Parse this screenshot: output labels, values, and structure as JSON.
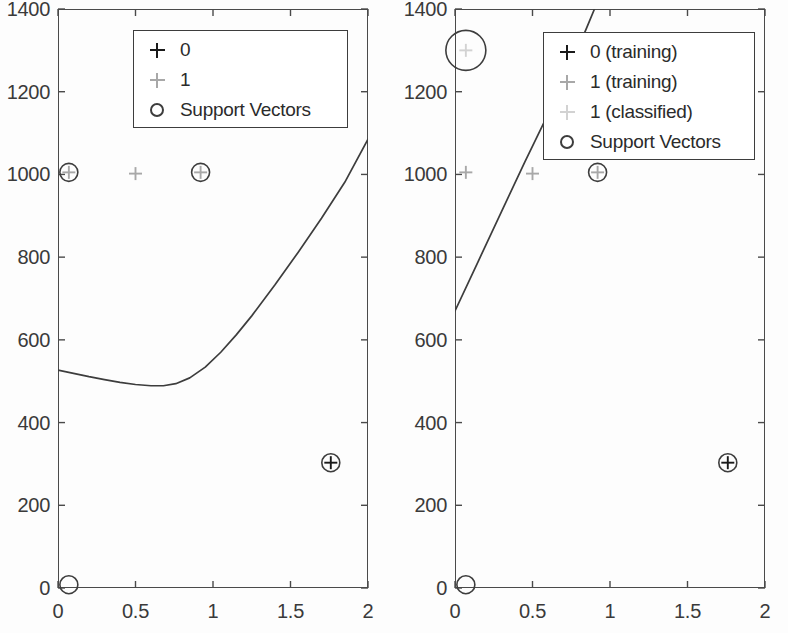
{
  "figure": {
    "background": "#fdfdfd",
    "axis_color": "#4a4a4a",
    "text_color": "#3a3a3a"
  },
  "colors": {
    "class0": "#1a1a1a",
    "class1_training": "#a8a8a8",
    "class1_classified": "#d2d2d2",
    "support_vector": "#3d3d3d",
    "boundary": "#3d3d3d"
  },
  "chart_data": [
    {
      "panel": "left",
      "type": "scatter",
      "title": "",
      "xlabel": "",
      "ylabel": "",
      "xlim": [
        0,
        2
      ],
      "ylim": [
        0,
        1400
      ],
      "xticks": [
        0,
        0.5,
        1,
        1.5,
        2
      ],
      "xtick_labels": [
        "0",
        "0.5",
        "1",
        "1.5",
        "2"
      ],
      "yticks": [
        0,
        200,
        400,
        600,
        800,
        1000,
        1200,
        1400
      ],
      "ytick_labels": [
        "0",
        "200",
        "400",
        "600",
        "800",
        "1000",
        "1200",
        "1400"
      ],
      "grid": false,
      "legend_position": "top-center",
      "legend": [
        {
          "marker": "plus",
          "color": "#1a1a1a",
          "label": "0"
        },
        {
          "marker": "plus",
          "color": "#a8a8a8",
          "label": "1"
        },
        {
          "marker": "circle",
          "color": "#3d3d3d",
          "label": "Support Vectors"
        }
      ],
      "series": [
        {
          "name": "1",
          "marker": "plus",
          "color": "#a8a8a8",
          "points": [
            {
              "x": 0.07,
              "y": 1005
            },
            {
              "x": 0.5,
              "y": 1002
            },
            {
              "x": 0.92,
              "y": 1005
            }
          ]
        },
        {
          "name": "0",
          "marker": "plus",
          "color": "#1a1a1a",
          "points": [
            {
              "x": 1.76,
              "y": 303
            }
          ]
        },
        {
          "name": "Support Vectors",
          "marker": "circle",
          "color": "#3d3d3d",
          "points": [
            {
              "x": 0.07,
              "y": 1005,
              "r": 9
            },
            {
              "x": 0.92,
              "y": 1005,
              "r": 9
            },
            {
              "x": 1.76,
              "y": 303,
              "r": 9
            },
            {
              "x": 0.07,
              "y": 8,
              "r": 9
            }
          ]
        }
      ],
      "boundary": {
        "name": "decision boundary",
        "color": "#3d3d3d",
        "points": [
          {
            "x": 0.0,
            "y": 527
          },
          {
            "x": 0.1,
            "y": 519
          },
          {
            "x": 0.2,
            "y": 511
          },
          {
            "x": 0.3,
            "y": 504
          },
          {
            "x": 0.4,
            "y": 497
          },
          {
            "x": 0.5,
            "y": 492
          },
          {
            "x": 0.6,
            "y": 489
          },
          {
            "x": 0.68,
            "y": 489
          },
          {
            "x": 0.76,
            "y": 494
          },
          {
            "x": 0.85,
            "y": 508
          },
          {
            "x": 0.95,
            "y": 534
          },
          {
            "x": 1.05,
            "y": 570
          },
          {
            "x": 1.15,
            "y": 612
          },
          {
            "x": 1.25,
            "y": 658
          },
          {
            "x": 1.4,
            "y": 733
          },
          {
            "x": 1.55,
            "y": 812
          },
          {
            "x": 1.7,
            "y": 894
          },
          {
            "x": 1.85,
            "y": 981
          },
          {
            "x": 2.0,
            "y": 1085
          }
        ]
      }
    },
    {
      "panel": "right",
      "type": "scatter",
      "title": "",
      "xlabel": "",
      "ylabel": "",
      "xlim": [
        0,
        2
      ],
      "ylim": [
        0,
        1400
      ],
      "xticks": [
        0,
        0.5,
        1,
        1.5,
        2
      ],
      "xtick_labels": [
        "0",
        "0.5",
        "1",
        "1.5",
        "2"
      ],
      "yticks": [
        0,
        200,
        400,
        600,
        800,
        1000,
        1200,
        1400
      ],
      "ytick_labels": [
        "0",
        "200",
        "400",
        "600",
        "800",
        "1000",
        "1200",
        "1400"
      ],
      "grid": false,
      "legend_position": "top-right",
      "legend": [
        {
          "marker": "plus",
          "color": "#1a1a1a",
          "label": "0 (training)"
        },
        {
          "marker": "plus",
          "color": "#a8a8a8",
          "label": "1 (training)"
        },
        {
          "marker": "plus",
          "color": "#d2d2d2",
          "label": "1 (classified)"
        },
        {
          "marker": "circle",
          "color": "#3d3d3d",
          "label": "Support Vectors"
        }
      ],
      "series": [
        {
          "name": "1 (training)",
          "marker": "plus",
          "color": "#a8a8a8",
          "points": [
            {
              "x": 0.07,
              "y": 1005
            },
            {
              "x": 0.5,
              "y": 1002
            },
            {
              "x": 0.92,
              "y": 1005
            }
          ]
        },
        {
          "name": "1 (classified)",
          "marker": "plus",
          "color": "#d2d2d2",
          "points": [
            {
              "x": 0.07,
              "y": 1300
            }
          ]
        },
        {
          "name": "0 (training)",
          "marker": "plus",
          "color": "#1a1a1a",
          "points": [
            {
              "x": 1.76,
              "y": 303
            }
          ]
        },
        {
          "name": "Support Vectors",
          "marker": "circle",
          "color": "#3d3d3d",
          "points": [
            {
              "x": 0.07,
              "y": 1300,
              "r": 20
            },
            {
              "x": 0.92,
              "y": 1005,
              "r": 9
            },
            {
              "x": 1.76,
              "y": 303,
              "r": 9
            },
            {
              "x": 0.07,
              "y": 8,
              "r": 9
            }
          ]
        }
      ],
      "boundary": {
        "name": "decision boundary",
        "color": "#3d3d3d",
        "points": [
          {
            "x": 0.0,
            "y": 670
          },
          {
            "x": 0.15,
            "y": 790
          },
          {
            "x": 0.3,
            "y": 910
          },
          {
            "x": 0.45,
            "y": 1030
          },
          {
            "x": 0.58,
            "y": 1130
          },
          {
            "x": 0.72,
            "y": 1240
          },
          {
            "x": 0.85,
            "y": 1355
          },
          {
            "x": 0.9,
            "y": 1400
          }
        ]
      }
    }
  ]
}
